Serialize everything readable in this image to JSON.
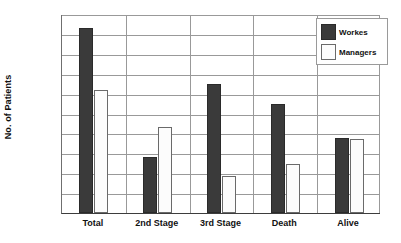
{
  "chart_data": {
    "type": "bar",
    "title": "",
    "xlabel": "",
    "ylabel": "No. of Patients",
    "ylim": [
      0,
      1000
    ],
    "ytick_step": 100,
    "yticks": [
      0,
      100,
      200,
      300,
      400,
      500,
      600,
      700,
      800,
      900,
      1000
    ],
    "categories": [
      "Total",
      "2nd Stage",
      "3rd Stage",
      "Death",
      "Alive"
    ],
    "series": [
      {
        "name": "Workes",
        "color": "#3a3a3a",
        "values": [
          930,
          280,
          650,
          550,
          375
        ]
      },
      {
        "name": "Managers",
        "color": "#fcfcfc",
        "values": [
          620,
          430,
          185,
          245,
          370
        ]
      }
    ],
    "grid": "horizontal-and-category-separators",
    "legend_position": "top-right"
  }
}
